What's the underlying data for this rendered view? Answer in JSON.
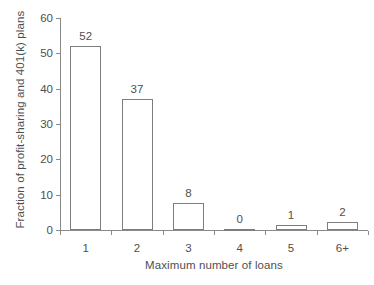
{
  "chart_data": {
    "type": "bar",
    "title": "",
    "subtitle": "",
    "xlabel": "Maximum number of loans",
    "ylabel": "Fraction of profit-sharing and  401(k) plans",
    "categories": [
      "1",
      "2",
      "3",
      "4",
      "5",
      "6+"
    ],
    "values": [
      52,
      37,
      8,
      0,
      1,
      2
    ],
    "bar_labels": [
      "52",
      "37",
      "8",
      "0",
      "1",
      "2"
    ],
    "ylim": [
      0,
      60
    ],
    "yticks": [
      0,
      10,
      20,
      30,
      40,
      50,
      60
    ],
    "ytick_labels": [
      "0",
      "10",
      "20",
      "30",
      "40",
      "50",
      "60"
    ],
    "grid": false,
    "legend": false,
    "series": [
      {
        "name": "Fraction of plans",
        "values": [
          52,
          37,
          8,
          0,
          1,
          2
        ]
      }
    ],
    "drawn_heights": [
      52,
      37,
      7.7,
      0.4,
      1.5,
      2.3
    ],
    "colors": {
      "bar_fill": "#ffffff",
      "bar_border": "#7d7d7d",
      "axis": "#8a8a8a",
      "text": "#4f4f4f",
      "background": "#ffffff"
    }
  }
}
